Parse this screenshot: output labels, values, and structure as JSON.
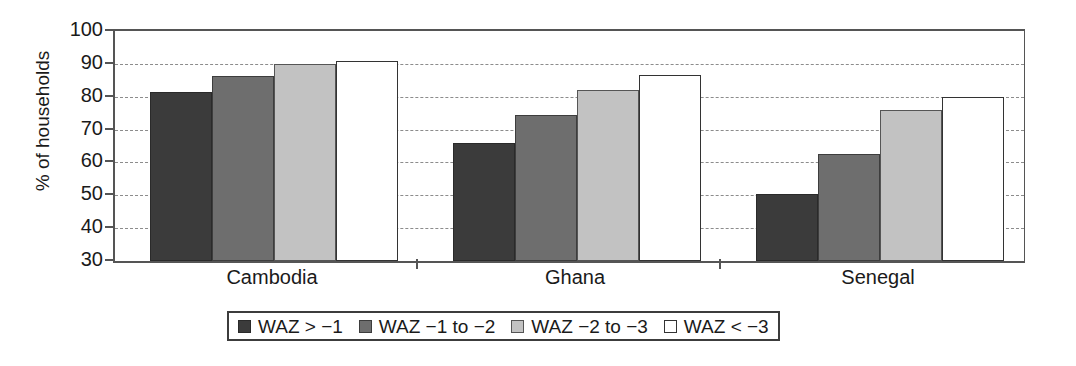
{
  "chart_data": {
    "type": "bar",
    "title": "",
    "xlabel": "",
    "ylabel": "% of households",
    "ylim": [
      30,
      100
    ],
    "yticks": [
      30,
      40,
      50,
      60,
      70,
      80,
      90,
      100
    ],
    "grid": true,
    "legend_position": "bottom",
    "categories": [
      "Cambodia",
      "Ghana",
      "Senegal"
    ],
    "series": [
      {
        "name": "WAZ > −1",
        "color": "#3b3b3b",
        "values": [
          81.5,
          65.8,
          50.3
        ]
      },
      {
        "name": "WAZ −1 to −2",
        "color": "#6e6e6e",
        "values": [
          86.3,
          74.5,
          62.5
        ]
      },
      {
        "name": "WAZ −2 to −3",
        "color": "#c2c2c2",
        "values": [
          90.0,
          82.0,
          76.0
        ]
      },
      {
        "name": "WAZ < −3",
        "color": "#ffffff",
        "values": [
          91.0,
          86.7,
          80.0
        ]
      }
    ]
  },
  "axis": {
    "y_title": "% of households",
    "tick_labels": [
      "100",
      "90",
      "80",
      "70",
      "60",
      "50",
      "40",
      "30"
    ]
  },
  "categories": [
    {
      "label": "Cambodia"
    },
    {
      "label": "Ghana"
    },
    {
      "label": "Senegal"
    }
  ],
  "legend": {
    "items": [
      {
        "label": "WAZ > −1"
      },
      {
        "label": "WAZ −1 to −2"
      },
      {
        "label": "WAZ −2 to −3"
      },
      {
        "label": "WAZ < −3"
      }
    ]
  }
}
